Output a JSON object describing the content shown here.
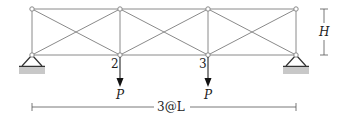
{
  "diagram": {
    "type": "truss",
    "colors": {
      "member": "#8a8a8a",
      "node_fill": "#ffffff",
      "support": "#333333",
      "ground": "#c8c8c8",
      "arrow": "#111111",
      "text": "#222222"
    },
    "panels": 3,
    "nodes": {
      "top": [
        [
          32,
          9
        ],
        [
          120,
          9
        ],
        [
          208,
          9
        ],
        [
          296,
          9
        ]
      ],
      "bottom": [
        [
          32,
          55
        ],
        [
          120,
          55
        ],
        [
          208,
          55
        ],
        [
          296,
          55
        ]
      ]
    },
    "node_labels": [
      {
        "id": "2",
        "text": "2"
      },
      {
        "id": "3",
        "text": "3"
      }
    ],
    "loads": [
      {
        "node": "2",
        "label": "P"
      },
      {
        "node": "3",
        "label": "P"
      }
    ],
    "height_label": "H",
    "span_label": "3@L",
    "supports": [
      "pin-left",
      "pin-right"
    ]
  }
}
